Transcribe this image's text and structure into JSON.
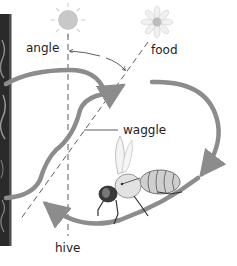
{
  "diagram": {
    "labels": {
      "angle": "angle",
      "food": "food",
      "waggle": "waggle",
      "hive": "hive"
    },
    "icons": {
      "sun": "sun-icon",
      "flower": "flower-icon",
      "bee": "bee-illustration",
      "honeycomb": "honeycomb-photo-strip"
    },
    "colors": {
      "arrow": "#8c8c8c",
      "sun": "#c8c8c8",
      "line": "#333333",
      "text": "#222222",
      "background": "#ffffff"
    }
  }
}
